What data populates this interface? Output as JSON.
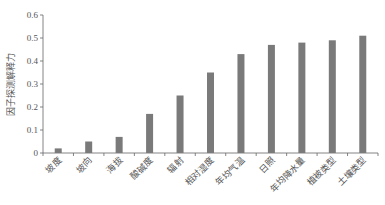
{
  "chart_data": {
    "type": "bar",
    "title": "",
    "xlabel": "",
    "ylabel": "因子探测解释力",
    "ylim": [
      0,
      0.6
    ],
    "yticks": [
      "0",
      "0.1",
      "0.2",
      "0.3",
      "0.4",
      "0.5",
      "0.6"
    ],
    "grid": false,
    "legend": null,
    "bar_color": "#7a7a7a",
    "categories": [
      "坡度",
      "坡向",
      "海拔",
      "酸碱度",
      "辐射",
      "相对湿度",
      "年均气温",
      "日照",
      "年均降水量",
      "植被类型",
      "土壤类型"
    ],
    "values": [
      0.02,
      0.05,
      0.07,
      0.17,
      0.25,
      0.35,
      0.43,
      0.47,
      0.48,
      0.49,
      0.51
    ]
  }
}
